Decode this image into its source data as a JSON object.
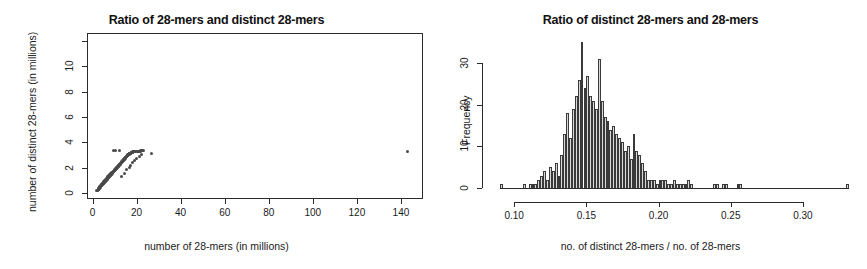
{
  "figure": {
    "width": 867,
    "height": 269,
    "background": "#ffffff",
    "foreground": "#1a1a1a"
  },
  "panels": [
    {
      "id": "left",
      "title": "Ratio of 28-mers and distinct 28-mers",
      "xlabel": "number of 28-mers (in millions)",
      "ylabel": "number of distinct 28-mers (in millions)"
    },
    {
      "id": "right",
      "title": "Ratio of distinct 28-mers and 28-mers",
      "xlabel": "no. of distinct 28-mers / no. of 28-mers",
      "ylabel": "Frequency"
    }
  ],
  "chart_data": [
    {
      "type": "scatter",
      "id": "scatter-28mers",
      "title": "Ratio of 28-mers and distinct 28-mers",
      "xlabel": "number of 28-mers (in millions)",
      "ylabel": "number of distinct 28-mers (in millions)",
      "xlim": [
        -2.5,
        150
      ],
      "ylim": [
        -0.45,
        12.6
      ],
      "xticks": [
        0,
        20,
        40,
        60,
        80,
        100,
        120,
        140
      ],
      "yticks": [
        0,
        2,
        4,
        6,
        8,
        10
      ],
      "extra_unlabeled_yticks": [
        12
      ],
      "grid": false,
      "legend": false,
      "point_color": "#4a4a4a",
      "n_points": 236,
      "x": [
        1.9,
        2.2,
        2.4,
        2.5,
        2.6,
        2.7,
        2.8,
        2.9,
        3.0,
        3.0,
        3.1,
        3.2,
        3.2,
        3.3,
        3.4,
        3.5,
        3.5,
        3.6,
        3.7,
        3.8,
        3.8,
        3.9,
        4.0,
        4.0,
        4.1,
        4.2,
        4.2,
        4.3,
        4.4,
        4.4,
        4.5,
        4.6,
        4.6,
        4.7,
        4.8,
        4.8,
        4.9,
        5.0,
        5.0,
        5.1,
        5.2,
        5.2,
        5.3,
        5.4,
        5.4,
        5.5,
        5.6,
        5.6,
        5.7,
        5.8,
        5.8,
        5.9,
        6.0,
        6.0,
        6.1,
        6.2,
        6.2,
        6.3,
        6.4,
        6.4,
        6.5,
        6.6,
        6.6,
        6.7,
        6.8,
        6.8,
        6.9,
        7.0,
        7.0,
        7.1,
        7.2,
        7.2,
        7.3,
        7.4,
        7.4,
        7.5,
        7.6,
        7.6,
        7.7,
        7.8,
        7.8,
        7.9,
        8.0,
        8.0,
        8.1,
        8.2,
        8.2,
        8.3,
        8.4,
        8.5,
        8.5,
        8.6,
        8.7,
        8.8,
        8.8,
        8.9,
        9.0,
        9.1,
        9.2,
        9.3,
        9.4,
        9.5,
        9.6,
        9.7,
        9.8,
        9.9,
        10.0,
        10.1,
        10.2,
        10.3,
        10.4,
        10.5,
        10.6,
        10.7,
        10.8,
        10.9,
        11.0,
        11.1,
        11.2,
        11.3,
        11.4,
        11.5,
        11.6,
        11.7,
        11.8,
        11.9,
        12.0,
        12.1,
        12.2,
        12.3,
        12.4,
        12.5,
        12.6,
        12.7,
        12.8,
        12.9,
        13.0,
        13.1,
        13.2,
        13.3,
        13.4,
        13.5,
        13.6,
        13.7,
        13.8,
        13.9,
        14.0,
        14.1,
        14.2,
        14.3,
        14.4,
        14.5,
        14.6,
        14.7,
        14.8,
        14.9,
        15.0,
        15.1,
        15.2,
        15.3,
        15.4,
        15.5,
        15.6,
        15.7,
        15.8,
        15.9,
        16.0,
        16.1,
        16.2,
        16.3,
        16.4,
        16.5,
        16.6,
        16.7,
        16.8,
        16.9,
        17.0,
        17.1,
        17.2,
        17.3,
        17.4,
        17.5,
        17.6,
        17.7,
        17.8,
        17.9,
        18.0,
        18.1,
        18.2,
        18.3,
        18.4,
        18.5,
        18.6,
        18.7,
        18.8,
        18.9,
        19.0,
        19.2,
        19.4,
        19.6,
        19.8,
        20.0,
        20.2,
        20.5,
        20.8,
        21.0,
        21.4,
        21.8,
        22.0,
        22.4,
        22.8,
        23.2,
        9.6,
        10.4,
        12.2,
        13.0,
        14.4,
        15.6,
        16.6,
        17.4,
        18.2,
        19.0,
        20.0,
        21.2,
        22.2,
        26.6,
        143.0
      ],
      "y": [
        0.18,
        0.22,
        0.25,
        0.27,
        0.3,
        0.32,
        0.34,
        0.36,
        0.38,
        0.44,
        0.4,
        0.42,
        0.5,
        0.45,
        0.47,
        0.49,
        0.56,
        0.52,
        0.54,
        0.56,
        0.63,
        0.58,
        0.6,
        0.68,
        0.62,
        0.64,
        0.72,
        0.66,
        0.68,
        0.76,
        0.7,
        0.72,
        0.8,
        0.74,
        0.76,
        0.84,
        0.78,
        0.8,
        0.88,
        0.82,
        0.84,
        0.92,
        0.86,
        0.88,
        0.96,
        0.9,
        0.92,
        1.0,
        0.94,
        0.96,
        1.04,
        0.98,
        1.0,
        1.08,
        1.02,
        1.04,
        1.12,
        1.06,
        1.08,
        1.16,
        1.1,
        1.12,
        1.2,
        1.14,
        1.16,
        1.24,
        1.18,
        1.2,
        1.28,
        1.22,
        1.24,
        1.32,
        1.26,
        1.28,
        1.36,
        1.3,
        1.32,
        1.4,
        1.34,
        1.36,
        1.44,
        1.38,
        1.4,
        1.48,
        1.42,
        1.44,
        1.52,
        1.46,
        1.48,
        1.5,
        1.58,
        1.52,
        1.54,
        1.56,
        1.64,
        1.58,
        1.6,
        1.62,
        1.64,
        1.66,
        1.68,
        1.7,
        1.72,
        1.74,
        1.76,
        1.78,
        1.8,
        1.82,
        1.84,
        1.86,
        1.88,
        1.9,
        1.92,
        1.94,
        1.96,
        1.98,
        2.0,
        2.02,
        2.04,
        2.06,
        2.08,
        2.1,
        2.12,
        2.14,
        2.16,
        2.18,
        2.2,
        2.22,
        2.24,
        2.26,
        2.28,
        2.3,
        2.32,
        2.34,
        2.36,
        2.38,
        2.4,
        2.42,
        2.44,
        2.46,
        2.48,
        2.5,
        2.52,
        2.54,
        2.56,
        2.58,
        2.6,
        2.62,
        2.64,
        2.66,
        2.68,
        2.7,
        2.72,
        2.74,
        2.76,
        2.78,
        2.8,
        2.82,
        2.84,
        2.86,
        2.88,
        2.9,
        2.92,
        2.94,
        2.96,
        2.98,
        3.0,
        3.02,
        3.04,
        3.05,
        3.06,
        3.07,
        3.08,
        3.09,
        3.1,
        3.11,
        3.12,
        3.13,
        3.14,
        3.15,
        3.16,
        3.17,
        3.18,
        3.19,
        3.2,
        3.21,
        3.22,
        3.23,
        3.24,
        3.25,
        3.25,
        3.26,
        3.26,
        3.27,
        3.27,
        3.28,
        3.28,
        3.29,
        3.29,
        3.3,
        3.3,
        3.3,
        3.31,
        3.31,
        3.31,
        3.32,
        3.32,
        3.32,
        3.33,
        3.33,
        3.33,
        3.33,
        3.33,
        3.33,
        3.33,
        1.35,
        1.55,
        1.85,
        2.0,
        2.2,
        2.45,
        2.6,
        2.75,
        2.9,
        3.05,
        3.15,
        3.25,
        3.3,
        3.95,
        11.8
      ],
      "outliers": [
        {
          "x": 143.0,
          "y": 11.8,
          "note": "far upper-right point"
        },
        {
          "x": 26.6,
          "y": 3.95,
          "note": "upper-right of main cluster"
        },
        {
          "x": 9.6,
          "y": 3.1,
          "note": "above-band point"
        }
      ]
    },
    {
      "type": "bar",
      "subtype": "histogram",
      "id": "histogram-ratio",
      "title": "Ratio of distinct 28-mers and 28-mers",
      "xlabel": "no. of distinct 28-mers / no. of 28-mers",
      "ylabel": "Frequency",
      "xlim": [
        0.086,
        0.334
      ],
      "ylim": [
        0,
        36
      ],
      "xticks": [
        0.1,
        0.15,
        0.2,
        0.25,
        0.3
      ],
      "xticklabels": [
        "0.10",
        "0.15",
        "0.20",
        "0.25",
        "0.30"
      ],
      "yticks": [
        0,
        10,
        20,
        30
      ],
      "yticklabels": [
        "0",
        "10",
        "20",
        "30"
      ],
      "grid": false,
      "legend": false,
      "bin_width": 0.002,
      "bar_fill": "#d9d9d9",
      "bar_edge": "#3a3a3a",
      "bin_starts": [
        0.09,
        0.092,
        0.094,
        0.096,
        0.098,
        0.1,
        0.102,
        0.104,
        0.106,
        0.108,
        0.11,
        0.112,
        0.114,
        0.116,
        0.118,
        0.12,
        0.122,
        0.124,
        0.126,
        0.128,
        0.13,
        0.132,
        0.134,
        0.136,
        0.138,
        0.14,
        0.142,
        0.144,
        0.146,
        0.148,
        0.15,
        0.152,
        0.154,
        0.156,
        0.158,
        0.16,
        0.162,
        0.164,
        0.166,
        0.168,
        0.17,
        0.172,
        0.174,
        0.176,
        0.178,
        0.18,
        0.182,
        0.184,
        0.186,
        0.188,
        0.19,
        0.192,
        0.194,
        0.196,
        0.198,
        0.2,
        0.202,
        0.204,
        0.206,
        0.208,
        0.21,
        0.212,
        0.214,
        0.216,
        0.218,
        0.22,
        0.222,
        0.224,
        0.226,
        0.228,
        0.23,
        0.232,
        0.234,
        0.236,
        0.238,
        0.24,
        0.242,
        0.244,
        0.246,
        0.248,
        0.25,
        0.252,
        0.254,
        0.256,
        0.258,
        0.26,
        0.262,
        0.264,
        0.266,
        0.268,
        0.27,
        0.272,
        0.274,
        0.276,
        0.278,
        0.28,
        0.282,
        0.284,
        0.286,
        0.288,
        0.29,
        0.292,
        0.294,
        0.296,
        0.298,
        0.3,
        0.302,
        0.304,
        0.306,
        0.308,
        0.31,
        0.312,
        0.314,
        0.316,
        0.318,
        0.32,
        0.322,
        0.324,
        0.326,
        0.328,
        0.33
      ],
      "counts": [
        1,
        0,
        0,
        0,
        0,
        0,
        0,
        0,
        1,
        0,
        1,
        1,
        1,
        2,
        3,
        4,
        2,
        5,
        4,
        6,
        3,
        8,
        13,
        18,
        12,
        19,
        22,
        26,
        35,
        24,
        27,
        22,
        21,
        19,
        31,
        21,
        17,
        16,
        14,
        15,
        13,
        12,
        11,
        9,
        10,
        7,
        13,
        9,
        8,
        6,
        4,
        2,
        2,
        2,
        1,
        2,
        2,
        2,
        1,
        1,
        2,
        1,
        1,
        1,
        1,
        2,
        1,
        0,
        0,
        0,
        0,
        0,
        0,
        0,
        1,
        1,
        0,
        1,
        1,
        0,
        0,
        0,
        1,
        1,
        0,
        0,
        0,
        0,
        0,
        0,
        0,
        0,
        0,
        0,
        0,
        0,
        0,
        0,
        0,
        0,
        0,
        0,
        0,
        0,
        0,
        0,
        0,
        0,
        0,
        0,
        0,
        0,
        0,
        0,
        0,
        0,
        0,
        0,
        0,
        0,
        1
      ],
      "peak": {
        "bin_center": 0.147,
        "count": 35
      },
      "secondary_peak": {
        "bin_center": 0.159,
        "count": 31
      },
      "far_tail_bar": {
        "bin_center": 0.331,
        "count": 1
      }
    }
  ]
}
